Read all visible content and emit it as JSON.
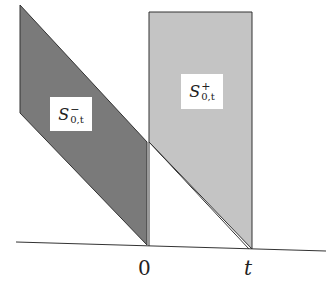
{
  "diagram": {
    "regions": [
      {
        "id": "S_minus",
        "label_base": "S",
        "label_sup": "−",
        "label_sub": "0,t",
        "fill": "#7a7a7a"
      },
      {
        "id": "S_plus",
        "label_base": "S",
        "label_sup": "+",
        "label_sub": "0,t",
        "fill": "#c4c4c4"
      }
    ],
    "axis": {
      "ticks": [
        {
          "label": "0"
        },
        {
          "label": "t"
        }
      ],
      "color": "#333333"
    }
  }
}
